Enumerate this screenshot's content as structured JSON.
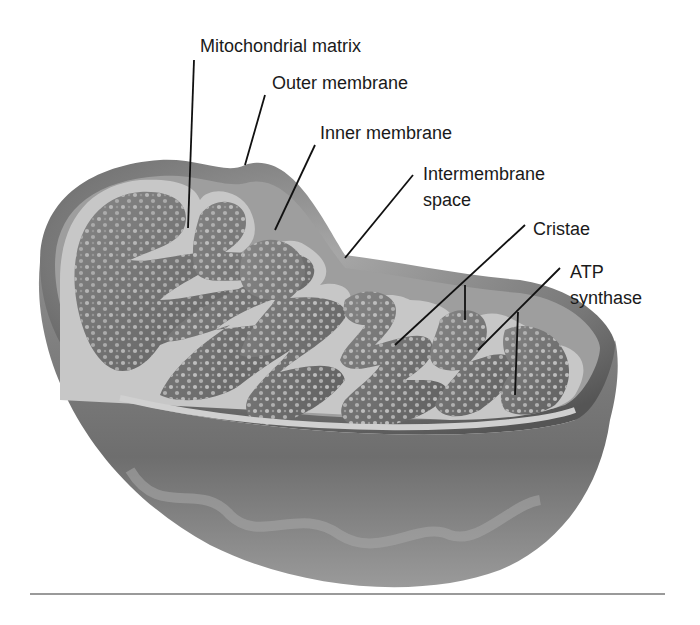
{
  "diagram": {
    "labels": [
      {
        "id": "matrix",
        "text": "Mitochondrial matrix"
      },
      {
        "id": "outer",
        "text": "Outer membrane"
      },
      {
        "id": "inner",
        "text": "Inner membrane"
      },
      {
        "id": "intermembrane",
        "line1": "Intermembrane",
        "line2": "space"
      },
      {
        "id": "cristae",
        "text": "Cristae"
      },
      {
        "id": "atp",
        "line1": "ATP",
        "line2": "synthase"
      }
    ],
    "colors": {
      "background": "#ffffff",
      "outer_shell": "#8a8a8a",
      "membrane": "#c8c8c8",
      "matrix": "#7a7a7a",
      "granule": "#b5b5b5",
      "leader_line": "#111111",
      "text": "#1a1a1a",
      "rule": "#9a9a9a"
    }
  }
}
